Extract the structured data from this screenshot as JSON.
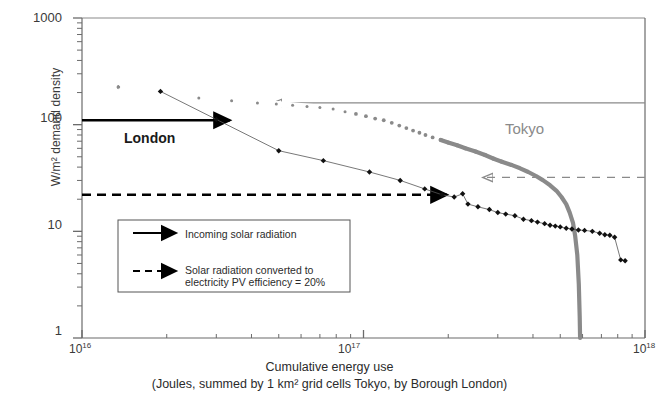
{
  "chart_data": {
    "type": "line",
    "title": "",
    "xlabel_line1": "Cumulative energy use",
    "xlabel_line2": "(Joules, summed by 1 km² grid cells Tokyo, by Borough London)",
    "ylabel": "W/m² demand density",
    "xscale": "log",
    "yscale": "log",
    "xlim": [
      1e+16,
      1e+18
    ],
    "ylim": [
      1,
      1000
    ],
    "xtick_labels": [
      "10",
      "10",
      "10"
    ],
    "xtick_exponents": [
      "16",
      "17",
      "18"
    ],
    "ytick_labels": [
      "1000",
      "100",
      "10",
      "1"
    ],
    "grid": false,
    "legend_position": "lower-left-inside",
    "series": [
      {
        "name": "London",
        "color": "#1a1a1a",
        "marker": "diamond",
        "linestyle": "thin-solid",
        "points": [
          [
            1.9e+16,
            205
          ],
          [
            3e+16,
            112
          ],
          [
            5e+16,
            57
          ],
          [
            7.2e+16,
            46
          ],
          [
            1.05e+17,
            36
          ],
          [
            1.35e+17,
            30
          ],
          [
            1.65e+17,
            25
          ],
          [
            1.9e+17,
            22
          ],
          [
            2.1e+17,
            21
          ],
          [
            2.25e+17,
            22.5
          ],
          [
            2.35e+17,
            18
          ],
          [
            2.55e+17,
            17
          ],
          [
            2.8e+17,
            16
          ],
          [
            3e+17,
            15
          ],
          [
            3.2e+17,
            14.5
          ],
          [
            3.45e+17,
            14
          ],
          [
            3.7e+17,
            13
          ],
          [
            3.95e+17,
            12.6
          ],
          [
            4.15e+17,
            12.2
          ],
          [
            4.4e+17,
            11.8
          ],
          [
            4.6e+17,
            11.4
          ],
          [
            4.8e+17,
            11.2
          ],
          [
            5e+17,
            11
          ],
          [
            5.25e+17,
            10.7
          ],
          [
            5.5e+17,
            10.5
          ],
          [
            5.8e+17,
            10.3
          ],
          [
            6.1e+17,
            10.2
          ],
          [
            6.5e+17,
            10
          ],
          [
            6.9e+17,
            9.6
          ],
          [
            7.2e+17,
            9.3
          ],
          [
            7.5e+17,
            9.2
          ],
          [
            7.8e+17,
            8.8
          ],
          [
            8.2e+17,
            5.4
          ],
          [
            8.5e+17,
            5.3
          ]
        ]
      },
      {
        "name": "Tokyo",
        "color": "#8a8a8a",
        "marker": "dot",
        "linestyle": "thick-solid",
        "points": [
          [
            1.35e+16,
            225
          ],
          [
            2.6e+16,
            178
          ],
          [
            3.4e+16,
            168
          ],
          [
            4.2e+16,
            160
          ],
          [
            4.9e+16,
            156
          ],
          [
            5.6e+16,
            152
          ],
          [
            6.3e+16,
            148
          ],
          [
            7e+16,
            145
          ],
          [
            7.8e+16,
            140
          ],
          [
            8.6e+16,
            132
          ],
          [
            9.4e+16,
            126
          ],
          [
            1.02e+17,
            120
          ],
          [
            1.1e+17,
            114
          ],
          [
            1.18e+17,
            110
          ],
          [
            1.26e+17,
            104
          ],
          [
            1.34e+17,
            98
          ],
          [
            1.42e+17,
            93
          ],
          [
            1.5e+17,
            88
          ],
          [
            1.58e+17,
            84
          ],
          [
            1.66e+17,
            80
          ],
          [
            1.76e+17,
            76
          ],
          [
            1.88e+17,
            72
          ],
          [
            2e+17,
            68
          ],
          [
            2.15e+17,
            64
          ],
          [
            2.3e+17,
            60
          ],
          [
            2.5e+17,
            56
          ],
          [
            2.7e+17,
            52
          ],
          [
            2.9e+17,
            48
          ],
          [
            3.1e+17,
            45
          ],
          [
            3.35e+17,
            42
          ],
          [
            3.6e+17,
            39
          ],
          [
            3.85e+17,
            36
          ],
          [
            4.1e+17,
            33
          ],
          [
            4.35e+17,
            30
          ],
          [
            4.6e+17,
            27
          ],
          [
            4.85e+17,
            24
          ],
          [
            5.05e+17,
            21
          ],
          [
            5.25e+17,
            18
          ],
          [
            5.4e+17,
            15
          ],
          [
            5.55e+17,
            12
          ],
          [
            5.65e+17,
            9
          ],
          [
            5.75e+17,
            6
          ],
          [
            5.82e+17,
            3.2
          ],
          [
            5.86e+17,
            1.6
          ],
          [
            5.88e+17,
            1.0
          ]
        ]
      }
    ],
    "reference_lines": [
      {
        "name": "incoming-solar-radiation",
        "value": 110,
        "color": "#000000",
        "style": "solid",
        "arrow": "right",
        "label": "Incoming solar radiation"
      },
      {
        "name": "solar-converted-pv",
        "value": 22,
        "color": "#000000",
        "style": "dashed",
        "arrow": "right",
        "label_line1": "Solar radiation converted to",
        "label_line2": "electricity PV efficiency = 20%"
      },
      {
        "name": "tokyo-incoming-solar-radiation",
        "value": 160,
        "color": "#8a8a8a",
        "style": "solid",
        "arrow": "left"
      },
      {
        "name": "tokyo-solar-converted-pv",
        "value": 32,
        "color": "#8a8a8a",
        "style": "dashed",
        "arrow": "left"
      }
    ],
    "annotations": [
      {
        "name": "london-label",
        "text": "London",
        "color": "#1a1a1a"
      },
      {
        "name": "tokyo-label",
        "text": "Tokyo",
        "color": "#8a8a8a"
      }
    ]
  },
  "legend": {
    "items": [
      {
        "label": "Incoming solar radiation",
        "style": "solid"
      },
      {
        "label_line1": "Solar radiation converted to",
        "label_line2": "electricity PV efficiency = 20%",
        "style": "dashed"
      }
    ]
  }
}
